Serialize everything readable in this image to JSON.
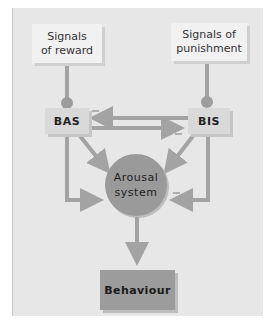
{
  "diagram": {
    "type": "flow-diagram",
    "nodes": {
      "signals_reward": "Signals\nof reward",
      "signals_reward_line1": "Signals",
      "signals_reward_line2": "of reward",
      "signals_punishment_line1": "Signals of",
      "signals_punishment_line2": "punishment",
      "bas": "BAS",
      "bis": "BIS",
      "arousal_line1": "Arousal",
      "arousal_line2": "system",
      "behaviour": "Behaviour"
    },
    "edges": [
      {
        "from": "Signals of reward",
        "to": "BAS",
        "style": "dot-terminated line"
      },
      {
        "from": "Signals of punishment",
        "to": "BIS",
        "style": "dot-terminated line"
      },
      {
        "from": "BIS",
        "to": "BAS",
        "sign": "−"
      },
      {
        "from": "BAS",
        "to": "BIS",
        "sign": "−"
      },
      {
        "from": "BAS",
        "to": "Arousal system",
        "sign": "+"
      },
      {
        "from": "BAS",
        "to": "Arousal system",
        "route": "left loop",
        "sign": "+"
      },
      {
        "from": "BIS",
        "to": "Arousal system",
        "sign": "+"
      },
      {
        "from": "BIS",
        "to": "Arousal system",
        "route": "right loop",
        "sign": "−"
      },
      {
        "from": "Arousal system",
        "to": "Behaviour"
      }
    ],
    "signs": {
      "minus": "−"
    },
    "colors": {
      "panel_bg": "#e7e7e7",
      "signal_box": "#f1f1f1",
      "node_box": "#d9d9d9",
      "arrow": "#a3a3a3",
      "arousal_circle": "#9a9a9a",
      "behaviour_box": "#9c9c9c"
    }
  }
}
